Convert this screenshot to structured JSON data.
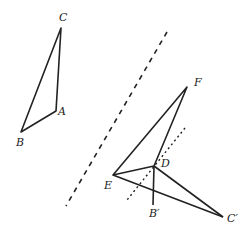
{
  "diagram": {
    "labels": {
      "C": "C",
      "A": "A",
      "B": "B",
      "F": "F",
      "D": "D",
      "E": "E",
      "B_prime": "B′",
      "C_prime": "C′"
    },
    "points": {
      "C": [
        61,
        28
      ],
      "A": [
        56,
        111
      ],
      "B": [
        21,
        132
      ],
      "F": [
        187,
        87
      ],
      "D": [
        154,
        166
      ],
      "E": [
        113,
        175
      ],
      "B_prime": [
        153,
        205
      ],
      "C_prime": [
        223,
        217
      ]
    },
    "colors": {
      "stroke": "#222222",
      "background": "#ffffff"
    }
  }
}
